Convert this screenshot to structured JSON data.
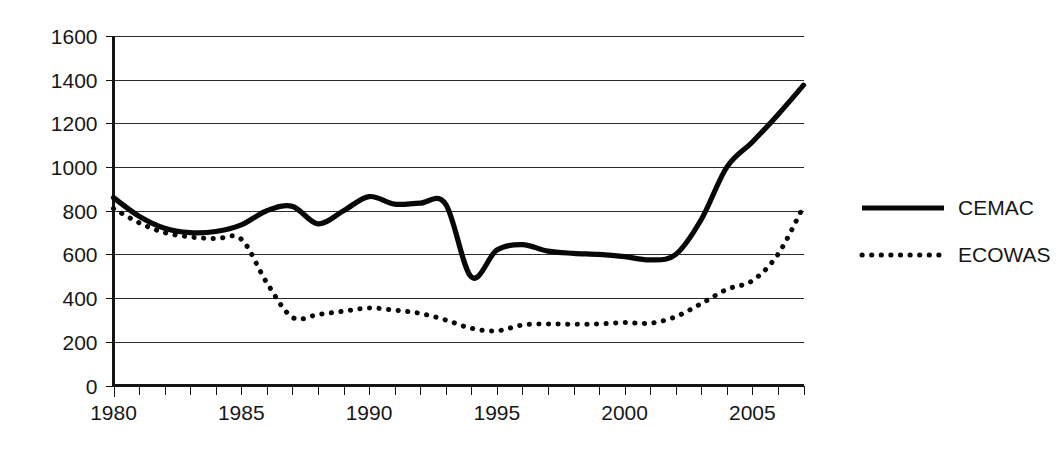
{
  "chart_data": {
    "type": "line",
    "title": "",
    "subtitle": "",
    "xlabel": "",
    "ylabel": "",
    "xlim": [
      1980,
      2007
    ],
    "ylim": [
      0,
      1600
    ],
    "grid": true,
    "grid_axis": "y",
    "legend_position": "right",
    "y_ticks": [
      0,
      200,
      400,
      600,
      800,
      1000,
      1200,
      1400,
      1600
    ],
    "y_tick_labels": [
      "0",
      "200",
      "400",
      "600",
      "800",
      "1000",
      "1200",
      "1400",
      "1600"
    ],
    "x_ticks": [
      1980,
      1985,
      1990,
      1995,
      2000,
      2005
    ],
    "x_tick_labels": [
      "1980",
      "1985",
      "1990",
      "1995",
      "2000",
      "2005"
    ],
    "x_minor_tick_interval": 1,
    "x": [
      1980,
      1981,
      1982,
      1983,
      1984,
      1985,
      1986,
      1987,
      1988,
      1989,
      1990,
      1991,
      1992,
      1993,
      1994,
      1995,
      1996,
      1997,
      1998,
      1999,
      2000,
      2001,
      2002,
      2003,
      2004,
      2005,
      2006,
      2007
    ],
    "series": [
      {
        "name": "CEMAC",
        "style": "solid",
        "color": "#080808",
        "values": [
          860,
          775,
          720,
          700,
          705,
          735,
          800,
          820,
          740,
          800,
          865,
          830,
          835,
          830,
          497,
          620,
          645,
          615,
          605,
          600,
          590,
          575,
          600,
          760,
          1000,
          1115,
          1240,
          1375
        ]
      },
      {
        "name": "ECOWAS",
        "style": "dotted",
        "color": "#080808",
        "values": [
          810,
          745,
          700,
          680,
          672,
          670,
          470,
          312,
          325,
          340,
          355,
          345,
          330,
          300,
          262,
          250,
          277,
          282,
          280,
          282,
          288,
          285,
          315,
          375,
          440,
          480,
          600,
          820
        ]
      }
    ],
    "legend": [
      {
        "label": "CEMAC",
        "style": "solid"
      },
      {
        "label": "ECOWAS",
        "style": "dotted"
      }
    ],
    "colors": {
      "background": "#ffffff",
      "gridline": "#2b2b2b",
      "axis": "#141414",
      "text": "#171717",
      "series": "#080808"
    }
  }
}
